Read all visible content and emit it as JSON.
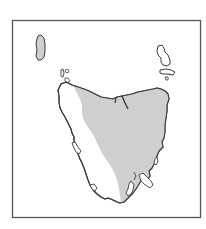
{
  "map": {
    "subject": "Tasmania distribution map",
    "colors": {
      "background": "#ffffff",
      "frame": "#555555",
      "coastline": "#3a3a3a",
      "distribution_fill": "#cfcfcf",
      "land_fill": "#ffffff"
    },
    "regions": [
      {
        "name": "King Island",
        "shaded": true
      },
      {
        "name": "Flinders Island",
        "shaded": false
      },
      {
        "name": "Cape Barren Island",
        "shaded": false
      },
      {
        "name": "Tasmania mainland",
        "shaded": "partial (north, central and east)"
      },
      {
        "name": "Bruny Island",
        "shaded": false
      }
    ]
  }
}
